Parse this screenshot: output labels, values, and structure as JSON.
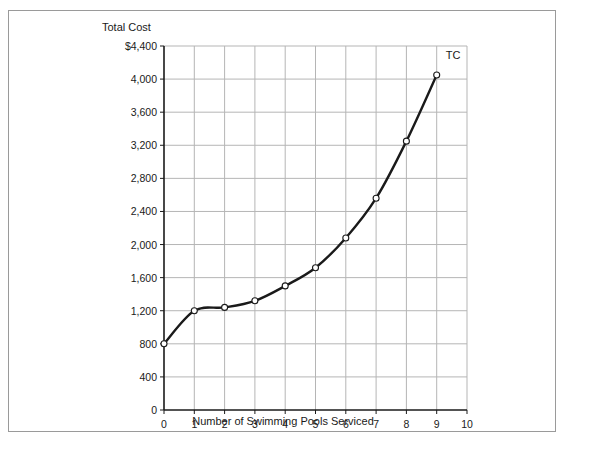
{
  "chart_data": {
    "type": "line",
    "title": "",
    "xlabel": "Number of Swimming Pools Serviced",
    "ylabel": "Total Cost",
    "xlim": [
      0,
      10
    ],
    "ylim": [
      0,
      4400
    ],
    "grid": true,
    "legend_position": "inline-right",
    "x_ticks": [
      "0",
      "1",
      "2",
      "3",
      "4",
      "5",
      "6",
      "7",
      "8",
      "9",
      "10"
    ],
    "y_ticks": [
      "0",
      "400",
      "800",
      "1,200",
      "1,600",
      "2,000",
      "2,400",
      "2,800",
      "3,200",
      "3,600",
      "4,000",
      "$4,400"
    ],
    "series": [
      {
        "name": "TC",
        "label": "TC",
        "color": "#1a1a1a",
        "x": [
          0,
          1,
          2,
          3,
          4,
          5,
          6,
          7,
          8,
          9
        ],
        "values": [
          800,
          1200,
          1240,
          1320,
          1500,
          1720,
          2080,
          2560,
          3250,
          4050
        ]
      }
    ],
    "annotations": [
      {
        "text": "TC",
        "x": 9,
        "y": 4050
      }
    ],
    "colors": {
      "line": "#1a1a1a",
      "grid": "#b5b5b5",
      "axis": "#1a1a1a",
      "marker_fill": "#ffffff",
      "frame": "#9a9a9a",
      "background": "#ffffff"
    }
  },
  "axis_titles": {
    "y": "Total Cost",
    "x": "Number of Swimming Pools Serviced"
  }
}
